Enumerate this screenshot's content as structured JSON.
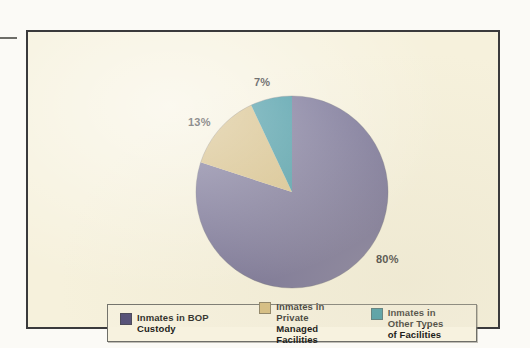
{
  "figure": {
    "background_color": "#F6F1DC",
    "frame_color": "#3A3A3C",
    "outside_color": "#FCFCFA",
    "crop_mark_name": "left-crop-mark"
  },
  "chart_data": {
    "type": "pie",
    "title": "",
    "subtitle": "",
    "xlabel": "",
    "ylabel": "",
    "grid": false,
    "legend_position": "bottom",
    "start_angle_deg": 0,
    "direction": "clockwise",
    "categories": [
      "Inmates in BOP Custody",
      "Inmates in Private Managed Facilities",
      "Inmates in Other Types of Facilities"
    ],
    "values": [
      80,
      13,
      7
    ],
    "value_unit": "%",
    "colors": [
      "#6B6690",
      "#D3B877",
      "#2C8E9D"
    ],
    "legend_swatch_colors": [
      "#4F4A74",
      "#D3B877",
      "#2C8E9D"
    ],
    "data_labels": [
      "80%",
      "13%",
      "7%"
    ],
    "slices": [
      {
        "label": "Inmates in BOP Custody",
        "value": 80,
        "data_label": "80%",
        "color": "#6B6690",
        "swatch_color": "#4F4A74"
      },
      {
        "label": "Inmates in Private Managed Facilities",
        "value": 13,
        "data_label": "13%",
        "color": "#D3B877",
        "swatch_color": "#D3B877"
      },
      {
        "label": "Inmates in Other Types of Facilities",
        "value": 7,
        "data_label": "7%",
        "color": "#2C8E9D",
        "swatch_color": "#2C8E9D"
      }
    ]
  },
  "labels": {
    "bop": "80%",
    "private": "13%",
    "other": "7%"
  },
  "legend": {
    "entries": [
      {
        "line1": "Inmates in BOP Custody",
        "line2": ""
      },
      {
        "line1": "Inmates in Private",
        "line2": "Managed Facilities"
      },
      {
        "line1": "Inmates in Other Types",
        "line2": "of Facilities"
      }
    ]
  }
}
